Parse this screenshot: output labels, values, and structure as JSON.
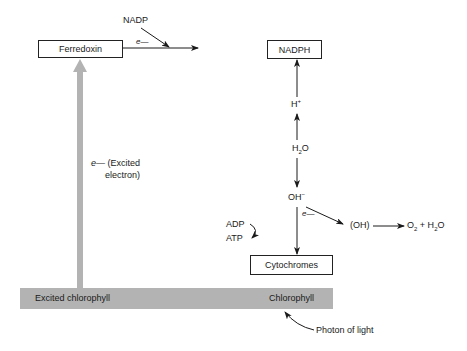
{
  "diagram": {
    "type": "photosynthesis light reaction electron flow",
    "nodes": {
      "ferredoxin": "Ferredoxin",
      "nadph": "NADPH",
      "cytochromes": "Cytochromes",
      "excited_chlorophyll": "Excited chlorophyll",
      "chlorophyll": "Chlorophyll"
    },
    "labels": {
      "nadp": "NADP",
      "e_ferredoxin": "e—",
      "h_plus": "H",
      "h_plus_sup": "+",
      "h2o_h": "H",
      "h2o_sub": "2",
      "h2o_o": "O",
      "oh_minus": "OH",
      "oh_minus_sup": "−",
      "e_oh": "e—",
      "oh_radical": "(OH)",
      "o2_o": "O",
      "o2_sub": "2",
      "o2_plus_h2o": " + H",
      "o2_h2o_sub": "2",
      "o2_h2o_o": "O",
      "adp": "ADP",
      "atp": "ATP",
      "excited_e": "e—",
      "excited_text_1": "(Excited",
      "excited_text_2": "electron)",
      "photon": "Photon of light"
    },
    "colors": {
      "band": "#b3b3b3",
      "thick_arrow": "#b3b3b3",
      "line": "#1a1a1a"
    }
  }
}
